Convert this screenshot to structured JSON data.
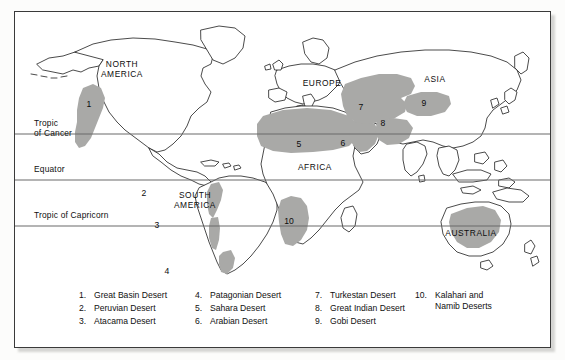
{
  "figure": {
    "shade_color": "#a9a9a7",
    "outline_color": "#2b2b2b",
    "line_color": "#6b6b6b",
    "border_color": "#3a3a3a"
  },
  "latitude_lines": [
    {
      "id": "tropic-of-cancer",
      "line1": "Tropic",
      "line2": "of Cancer"
    },
    {
      "id": "equator",
      "line1": "Equator",
      "line2": ""
    },
    {
      "id": "tropic-of-capricorn",
      "line1": "Tropic of Capricorn",
      "line2": ""
    }
  ],
  "continents": [
    {
      "id": "north-america",
      "line1": "NORTH",
      "line2": "AMERICA"
    },
    {
      "id": "south-america",
      "line1": "SOUTH",
      "line2": "AMERICA"
    },
    {
      "id": "europe",
      "line1": "EUROPE",
      "line2": ""
    },
    {
      "id": "africa",
      "line1": "AFRICA",
      "line2": ""
    },
    {
      "id": "asia",
      "line1": "ASIA",
      "line2": ""
    },
    {
      "id": "australia",
      "line1": "AUSTRALIA",
      "line2": ""
    }
  ],
  "map_markers": {
    "n1": "1",
    "n2": "2",
    "n3": "3",
    "n4": "4",
    "n5": "5",
    "n6": "6",
    "n7": "7",
    "n8": "8",
    "n9": "9",
    "n10": "10"
  },
  "legend": {
    "columns": [
      {
        "items": [
          {
            "num": "1.",
            "name": "Great Basin Desert",
            "name2": ""
          },
          {
            "num": "2.",
            "name": "Peruvian Desert",
            "name2": ""
          },
          {
            "num": "3.",
            "name": "Atacama Desert",
            "name2": ""
          }
        ]
      },
      {
        "items": [
          {
            "num": "4.",
            "name": "Patagonian Desert",
            "name2": ""
          },
          {
            "num": "5.",
            "name": "Sahara Desert",
            "name2": ""
          },
          {
            "num": "6.",
            "name": "Arabian Desert",
            "name2": ""
          }
        ]
      },
      {
        "items": [
          {
            "num": "7.",
            "name": "Turkestan Desert",
            "name2": ""
          },
          {
            "num": "8.",
            "name": "Great Indian Desert",
            "name2": ""
          },
          {
            "num": "9.",
            "name": "Gobi Desert",
            "name2": ""
          }
        ]
      },
      {
        "items": [
          {
            "num": "10.",
            "name": "Kalahari and",
            "name2": "Namib Deserts"
          }
        ]
      }
    ]
  }
}
